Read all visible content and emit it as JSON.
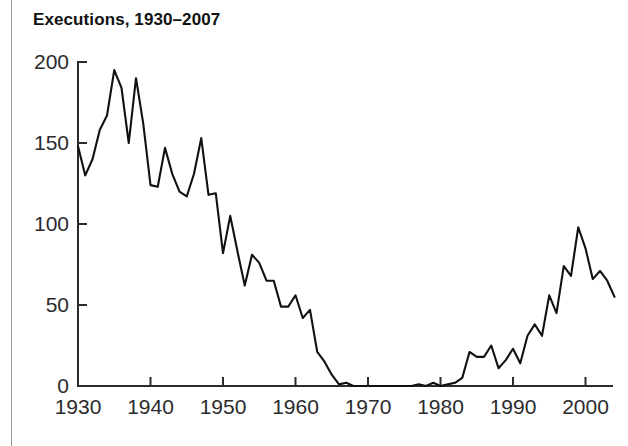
{
  "figure": {
    "title": "Executions, 1930–2007",
    "background_color": "#ffffff",
    "line_color": "#111111",
    "axis_color": "#2b2b2b"
  },
  "chart_data": {
    "type": "line",
    "title": "Executions, 1930–2007",
    "xlabel": "",
    "ylabel": "",
    "xlim": [
      1930,
      2007
    ],
    "ylim": [
      0,
      200
    ],
    "grid": false,
    "legend": null,
    "x_ticks": [
      "1930",
      "1940",
      "1950",
      "1960",
      "1970",
      "1980",
      "1990",
      "2000"
    ],
    "x_tick_values": [
      1930,
      1940,
      1950,
      1960,
      1970,
      1980,
      1990,
      2000
    ],
    "y_ticks": [
      "0",
      "50",
      "100",
      "150",
      "200"
    ],
    "y_tick_values": [
      0,
      50,
      100,
      150,
      200
    ],
    "series": [
      {
        "name": "Executions",
        "x": [
          1930,
          1931,
          1932,
          1933,
          1934,
          1935,
          1936,
          1937,
          1938,
          1939,
          1940,
          1941,
          1942,
          1943,
          1944,
          1945,
          1946,
          1947,
          1948,
          1949,
          1950,
          1951,
          1952,
          1953,
          1954,
          1955,
          1956,
          1957,
          1958,
          1959,
          1960,
          1961,
          1962,
          1963,
          1964,
          1965,
          1966,
          1967,
          1968,
          1969,
          1970,
          1971,
          1972,
          1973,
          1974,
          1975,
          1976,
          1977,
          1978,
          1979,
          1980,
          1981,
          1982,
          1983,
          1984,
          1985,
          1986,
          1987,
          1988,
          1989,
          1990,
          1991,
          1992,
          1993,
          1994,
          1995,
          1996,
          1997,
          1998,
          1999,
          2000,
          2001,
          2002,
          2003,
          2004
        ],
        "values": [
          148,
          130,
          140,
          158,
          167,
          195,
          184,
          150,
          190,
          162,
          124,
          123,
          147,
          131,
          120,
          117,
          131,
          153,
          118,
          119,
          82,
          105,
          83,
          62,
          81,
          76,
          65,
          65,
          49,
          49,
          56,
          42,
          47,
          21,
          15,
          7,
          1,
          2,
          0,
          0,
          0,
          0,
          0,
          0,
          0,
          0,
          0,
          1,
          0,
          2,
          0,
          1,
          2,
          5,
          21,
          18,
          18,
          25,
          11,
          16,
          23,
          14,
          31,
          38,
          31,
          56,
          45,
          74,
          68,
          98,
          85,
          66,
          71,
          65,
          55
        ]
      }
    ]
  }
}
